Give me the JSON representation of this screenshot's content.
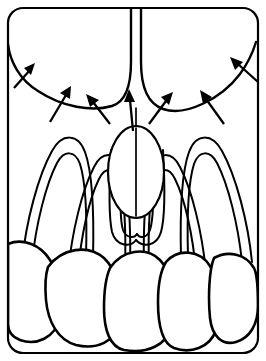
{
  "figure": {
    "title": "Maxillary anterior palatal anatomy line drawing",
    "background_color": "#ffffff",
    "line_color": "#000000",
    "canvas": {
      "width": 266,
      "height": 361
    }
  },
  "frame": {
    "name": "rounded-rectangle-border",
    "corner_radius": 16,
    "stroke_width": 2.2,
    "inset": 7
  },
  "structures": [
    {
      "id": "palate-left-lobe",
      "label": "Left palatal mucosa lobe",
      "interactable": false
    },
    {
      "id": "palate-right-lobe",
      "label": "Right palatal mucosa lobe",
      "interactable": false
    },
    {
      "id": "midline-raphe",
      "label": "Median palatine raphe",
      "interactable": false
    },
    {
      "id": "incisive-papilla",
      "label": "Incisive papilla",
      "interactable": false
    },
    {
      "id": "root-outline-far-left",
      "label": "Canine root outline (left)",
      "interactable": false
    },
    {
      "id": "root-outline-left",
      "label": "Lateral incisor root outline (left)",
      "interactable": false
    },
    {
      "id": "root-outline-center",
      "label": "Central incisor root outline",
      "interactable": false
    },
    {
      "id": "root-outline-right",
      "label": "Lateral incisor root outline (right)",
      "interactable": false
    },
    {
      "id": "root-outline-far-right",
      "label": "Canine root outline (right)",
      "interactable": false
    },
    {
      "id": "crown-far-left",
      "label": "Canine crown (left)",
      "interactable": false
    },
    {
      "id": "crown-left",
      "label": "Lateral incisor crown (left)",
      "interactable": false
    },
    {
      "id": "crown-center-left",
      "label": "Central incisor crown (left)",
      "interactable": false
    },
    {
      "id": "crown-center-right",
      "label": "Central incisor crown (right)",
      "interactable": false
    },
    {
      "id": "crown-right",
      "label": "Lateral incisor crown (right)",
      "interactable": false
    },
    {
      "id": "crown-far-right",
      "label": "Canine crown (right)",
      "interactable": false
    }
  ],
  "annotations": {
    "arrow_count": 7,
    "arrow_color": "#000000",
    "arrows": [
      {
        "id": "arrow-1",
        "label": "gingival-margin-pointer-far-left",
        "tail": [
          12,
          88
        ],
        "tip": [
          33,
          66
        ]
      },
      {
        "id": "arrow-2",
        "label": "gingival-margin-pointer-left-outer",
        "tail": [
          50,
          122
        ],
        "tip": [
          70,
          88
        ]
      },
      {
        "id": "arrow-3",
        "label": "gingival-margin-pointer-left-inner",
        "tail": [
          109,
          124
        ],
        "tip": [
          88,
          95
        ]
      },
      {
        "id": "arrow-4",
        "label": "incisive-papilla-pointer",
        "tail": [
          133,
          131
        ],
        "tip": [
          129,
          90
        ]
      },
      {
        "id": "arrow-5",
        "label": "gingival-margin-pointer-right-inner",
        "tail": [
          148,
          124
        ],
        "tip": [
          170,
          93
        ]
      },
      {
        "id": "arrow-6",
        "label": "gingival-margin-pointer-right-outer",
        "tail": [
          223,
          124
        ],
        "tip": [
          202,
          91
        ]
      },
      {
        "id": "arrow-7",
        "label": "gingival-margin-pointer-far-right",
        "tail": [
          258,
          82
        ],
        "tip": [
          230,
          57
        ]
      }
    ]
  }
}
